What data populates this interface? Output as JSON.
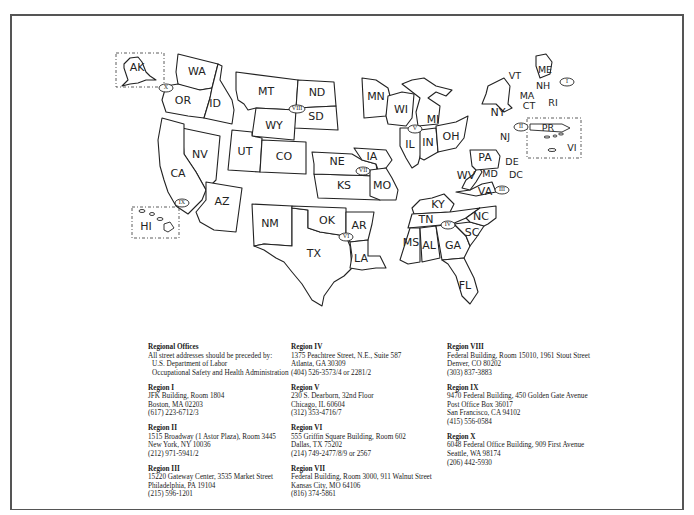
{
  "map": {
    "states": [
      "AK",
      "WA",
      "OR",
      "ID",
      "MT",
      "ND",
      "SD",
      "WY",
      "UT",
      "CO",
      "NV",
      "CA",
      "AZ",
      "HI",
      "NM",
      "TX",
      "OK",
      "KS",
      "NE",
      "IA",
      "MO",
      "AR",
      "LA",
      "MN",
      "WI",
      "MI",
      "IL",
      "IN",
      "OH",
      "KY",
      "TN",
      "MS",
      "AL",
      "GA",
      "FL",
      "SC",
      "NC",
      "VA",
      "WV",
      "PA",
      "MD",
      "DE",
      "DC",
      "NY",
      "NJ",
      "VT",
      "NH",
      "ME",
      "MA",
      "CT",
      "RI",
      "PR",
      "VI"
    ],
    "region_markers": [
      "I",
      "II",
      "III",
      "IV",
      "V",
      "VI",
      "VII",
      "VIII",
      "IX",
      "X"
    ]
  },
  "offices": {
    "heading": "Regional Offices",
    "intro": [
      "All street addresses should be preceded by:",
      "U.S. Department of Labor",
      "Occupational Safety and Health Administration"
    ],
    "regions": [
      {
        "name": "Region I",
        "lines": [
          "JFK Building, Room 1804",
          "Boston, MA 02203",
          "(617) 223-6712/3"
        ]
      },
      {
        "name": "Region II",
        "lines": [
          "1515 Broadway (1 Astor Plaza), Room 3445",
          "New York, NY 10036",
          "(212) 971-5941/2"
        ]
      },
      {
        "name": "Region III",
        "lines": [
          "15220 Gateway Center, 3535 Market Street",
          "Philadelphia, PA 19104",
          "(215) 596-1201"
        ]
      },
      {
        "name": "Region IV",
        "lines": [
          "1375 Peachtree Street, N.E., Suite 587",
          "Atlanta, GA 30309",
          "(404) 526-3573/4 or 2281/2"
        ]
      },
      {
        "name": "Region V",
        "lines": [
          "230 S. Dearborn, 32nd Floor",
          "Chicago, IL 60604",
          "(312) 353-4716/7"
        ]
      },
      {
        "name": "Region VI",
        "lines": [
          "555 Griffin Square Building, Room 602",
          "Dallas, TX 75202",
          "(214) 749-2477/8/9 or 2567"
        ]
      },
      {
        "name": "Region VII",
        "lines": [
          "Federal Building, Room 3000, 911 Walnut Street",
          "Kansas City, MO 64106",
          "(816) 374-5861"
        ]
      },
      {
        "name": "Region VIII",
        "lines": [
          "Federal Building, Room 15010, 1961 Stout Street",
          "Denver, CO 80202",
          "(303) 837-3883"
        ]
      },
      {
        "name": "Region IX",
        "lines": [
          "9470 Federal Building, 450 Golden Gate Avenue",
          "Post Office Box 36017",
          "San Francisco, CA 94102",
          "(415) 556-0584"
        ]
      },
      {
        "name": "Region X",
        "lines": [
          "6048 Federal Office Building, 909 First Avenue",
          "Seattle, WA 98174",
          "(206) 442-5930"
        ]
      }
    ]
  }
}
